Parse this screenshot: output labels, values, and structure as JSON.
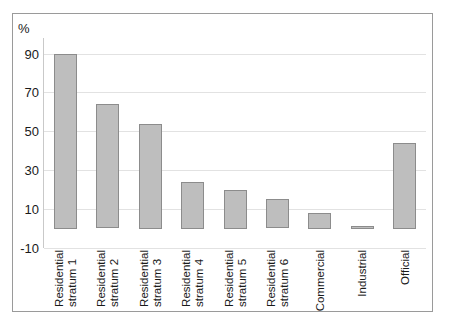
{
  "chart_data": {
    "type": "bar",
    "title": "",
    "subtitle": "",
    "xlabel": "",
    "ylabel": "%",
    "unit_label": "%",
    "categories": [
      "Residential stratum 1",
      "Residential stratum 2",
      "Residential stratum 3",
      "Residential stratum 4",
      "Residential stratum 5",
      "Residential stratum 6",
      "Commercial",
      "Industrial",
      "Official"
    ],
    "category_lines": [
      [
        "Residential",
        "stratum 1"
      ],
      [
        "Residential",
        "stratum 2"
      ],
      [
        "Residential",
        "stratum 3"
      ],
      [
        "Residential",
        "stratum 4"
      ],
      [
        "Residential",
        "stratum 5"
      ],
      [
        "Residential",
        "stratum 6"
      ],
      [
        "Commercial",
        ""
      ],
      [
        "Industrial",
        ""
      ],
      [
        "Official",
        ""
      ]
    ],
    "values": [
      90,
      64,
      54,
      24,
      20,
      15,
      8,
      1,
      44
    ],
    "ylim": [
      -10,
      98
    ],
    "yticks": [
      90,
      70,
      50,
      30,
      10,
      -10
    ],
    "ytick_labels": [
      "90",
      "70",
      "50",
      "30",
      "10",
      "-10"
    ],
    "grid": true,
    "grid_axis": "y",
    "legend": "none",
    "colors": {
      "bar_fill": "#bebebe",
      "bar_border": "#8c8c8c",
      "gridline": "#e2e2e2",
      "axis": "#c9c9c9",
      "frame": "#9a9a9a",
      "text": "#1a1a1a",
      "background": "#ffffff"
    }
  }
}
